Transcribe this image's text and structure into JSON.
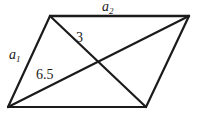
{
  "figure": {
    "kind": "parallelogram-with-diagonals",
    "stroke_color": "#1b1b1b",
    "background_color": "#ffffff",
    "stroke_width": 2,
    "labels": {
      "top_side": {
        "base": "a",
        "sub": "2",
        "text": "a2"
      },
      "left_side": {
        "base": "a",
        "sub": "1",
        "text": "a1"
      },
      "diagonal_short": "3",
      "diagonal_long": "6.5"
    },
    "vertices": {
      "top_left": [
        50,
        16
      ],
      "top_right": [
        189,
        16
      ],
      "bottom_right": [
        146,
        107
      ],
      "bottom_left": [
        8,
        107
      ]
    },
    "edges": [
      {
        "name": "top-side",
        "from": "top_left",
        "to": "top_right",
        "label": "a2"
      },
      {
        "name": "right-side",
        "from": "top_right",
        "to": "bottom_right",
        "label": ""
      },
      {
        "name": "bottom-side",
        "from": "bottom_right",
        "to": "bottom_left",
        "label": ""
      },
      {
        "name": "left-side",
        "from": "bottom_left",
        "to": "top_left",
        "label": "a1"
      }
    ],
    "diagonals": [
      {
        "name": "diagonal-top-left-to-bottom-right",
        "from": "top_left",
        "to": "bottom_right",
        "label": "3"
      },
      {
        "name": "diagonal-bottom-left-to-top-right",
        "from": "bottom_left",
        "to": "top_right",
        "label": "6.5"
      }
    ],
    "intersection": [
      98,
      62
    ]
  }
}
